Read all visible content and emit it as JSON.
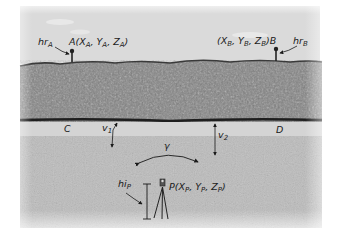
{
  "figure": {
    "type": "surveying-resection-diagram",
    "colors": {
      "sky": "#dcdcdc",
      "hedge": "#7a7a7a",
      "hedge_dark": "#3a3a3a",
      "road": "#d2d2d2",
      "field": "#bdbdbd",
      "ink": "#1a1a1a"
    }
  },
  "labels": {
    "hr_a": {
      "main": "hr",
      "sub": "A"
    },
    "point_a": {
      "prefix": "A(X",
      "sub1": "A",
      "mid1": ", Y",
      "sub2": "A",
      "mid2": ", Z",
      "sub3": "A",
      "suffix": ")"
    },
    "point_b": {
      "prefix": "(X",
      "sub1": "B",
      "mid1": ", Y",
      "sub2": "B",
      "mid2": ", Z",
      "sub3": "B",
      "suffix": ")B"
    },
    "hr_b": {
      "main": "hr",
      "sub": "B"
    },
    "c": "C",
    "d": "D",
    "v1": {
      "main": "v",
      "sub": "1"
    },
    "v2": {
      "main": "v",
      "sub": "2"
    },
    "gamma": "γ",
    "hi_p": {
      "main": "hi",
      "sub": "P"
    },
    "point_p": {
      "prefix": "P(X",
      "sub1": "P",
      "mid1": ", Y",
      "sub2": "P",
      "mid2": ", Z",
      "sub3": "P",
      "suffix": ")"
    }
  }
}
